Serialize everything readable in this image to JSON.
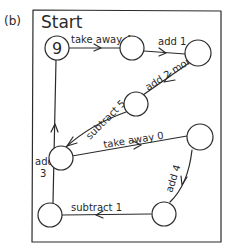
{
  "panel_label": "(b)",
  "title": "Start",
  "nodes": [
    {
      "id": "n1",
      "value": "9"
    },
    {
      "id": "n2",
      "value": ""
    },
    {
      "id": "n3",
      "value": ""
    },
    {
      "id": "n4",
      "value": ""
    },
    {
      "id": "n5",
      "value": ""
    },
    {
      "id": "n6",
      "value": ""
    },
    {
      "id": "n7",
      "value": ""
    },
    {
      "id": "n8",
      "value": ""
    }
  ],
  "edges": [
    {
      "from": "n1",
      "to": "n2",
      "label": "take away 4"
    },
    {
      "from": "n2",
      "to": "n3",
      "label": "add 1"
    },
    {
      "from": "n3",
      "to": "n4",
      "label": "add 2 more"
    },
    {
      "from": "n4",
      "to": "n5",
      "label": "subtract 5"
    },
    {
      "from": "n5",
      "to": "n6",
      "label": "take away 0"
    },
    {
      "from": "n6",
      "to": "n7",
      "label": "add 4"
    },
    {
      "from": "n7",
      "to": "n8",
      "label": "subtract 1"
    },
    {
      "from": "n8",
      "to": "n1",
      "label_line1": "add",
      "label_line2": "3"
    }
  ],
  "colors": {
    "ink": "#2a2a2a",
    "background": "#ffffff"
  }
}
